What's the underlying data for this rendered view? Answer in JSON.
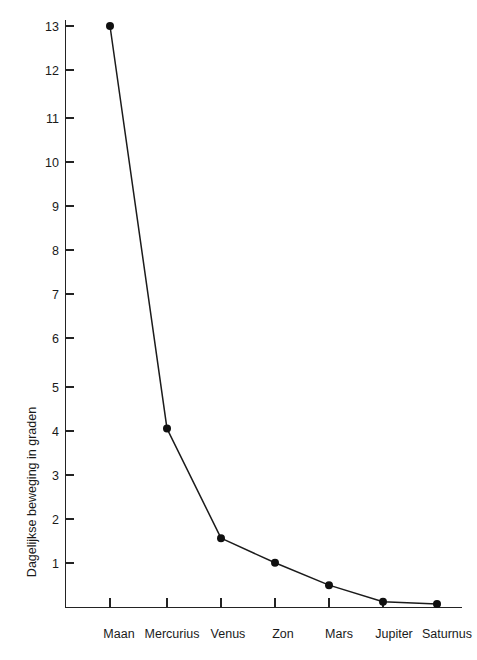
{
  "chart_data": {
    "type": "line",
    "title": "",
    "xlabel": "",
    "ylabel": "Dagelijkse beweging in graden",
    "categories": [
      "Maan",
      "Mercurius",
      "Venus",
      "Zon",
      "Mars",
      "Jupiter",
      "Saturnus"
    ],
    "values": [
      13.0,
      4.0,
      1.55,
      1.0,
      0.5,
      0.13,
      0.08
    ],
    "series": [
      {
        "name": "Dagelijkse beweging",
        "values": [
          13.0,
          4.0,
          1.55,
          1.0,
          0.5,
          0.13,
          0.08
        ]
      }
    ],
    "ylim": [
      0,
      13
    ],
    "xlim": [
      0,
      8
    ],
    "y_ticks": [
      1,
      2,
      3,
      4,
      5,
      6,
      7,
      8,
      9,
      10,
      11,
      12,
      13
    ],
    "y_tick_labels": [
      "1",
      "2",
      "3",
      "4",
      "5",
      "6",
      "7",
      "8",
      "9",
      "10",
      "11",
      "12",
      "13"
    ],
    "x_tick_labels": [
      "Maan",
      "Mercurius",
      "Venus",
      "Zon",
      "Mars",
      "Jupiter",
      "Saturnus"
    ],
    "grid": false,
    "legend": false,
    "legend_position": "none",
    "marker": "filled-circle",
    "line_color": "#1b1b1b",
    "marker_color": "#101010",
    "axis_color": "#232323",
    "background_color": "#ffffff"
  }
}
